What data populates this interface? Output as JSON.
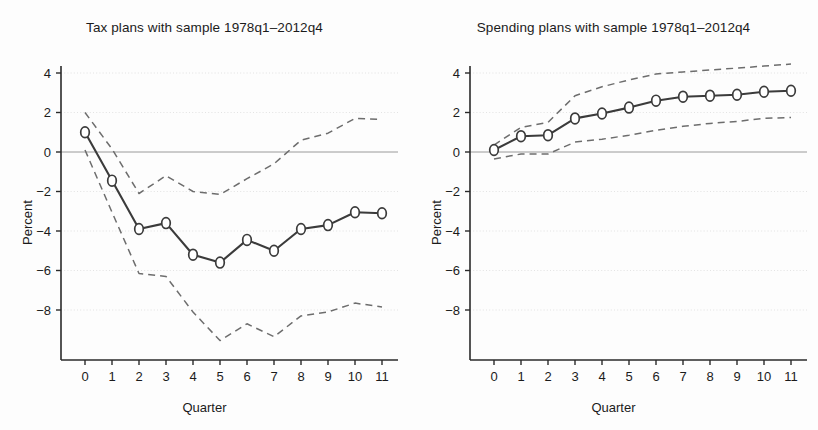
{
  "figure": {
    "axis_label_y": "Percent",
    "axis_label_x": "Quarter"
  },
  "panels": [
    {
      "title": "Tax plans with sample 1978q1–2012q4"
    },
    {
      "title": "Spending plans with sample 1978q1–2012q4"
    }
  ],
  "axes": {
    "y_ticks": [
      "4",
      "2",
      "0",
      "−2",
      "−4",
      "−6",
      "−8"
    ],
    "x_ticks": [
      "0",
      "1",
      "2",
      "3",
      "4",
      "5",
      "6",
      "7",
      "8",
      "9",
      "10",
      "11"
    ],
    "ylim": [
      -9.6,
      4.6
    ],
    "xlim": [
      -0.55,
      11.55
    ]
  },
  "style": {
    "line_color": "#3b3b3b",
    "band_color": "#6d6d6d",
    "grid_color": "#dcdcdc",
    "zero_line_color": "#9a9a9a",
    "axis_color": "#2a2a2a",
    "marker_fill": "#ffffff"
  },
  "chart_data": [
    {
      "type": "line",
      "title": "Tax plans with sample 1978q1–2012q4",
      "xlabel": "Quarter",
      "ylabel": "Percent",
      "xlim": [
        -0.55,
        11.55
      ],
      "ylim": [
        -9.6,
        4.6
      ],
      "grid": true,
      "legend": "none",
      "x": [
        0,
        1,
        2,
        3,
        4,
        5,
        6,
        7,
        8,
        9,
        10,
        11
      ],
      "series": [
        {
          "name": "Point estimate",
          "style": "solid-with-circle-markers",
          "values": [
            1.0,
            -1.45,
            -3.9,
            -3.6,
            -5.2,
            -5.6,
            -4.45,
            -5.0,
            -3.9,
            -3.7,
            -3.05,
            -3.1
          ]
        },
        {
          "name": "Upper confidence band",
          "style": "dashed",
          "values": [
            2.0,
            0.15,
            -2.1,
            -1.2,
            -2.0,
            -2.15,
            -1.35,
            -0.6,
            0.6,
            0.95,
            1.7,
            1.65
          ]
        },
        {
          "name": "Lower confidence band",
          "style": "dashed",
          "values": [
            0.1,
            -3.05,
            -6.15,
            -6.3,
            -8.1,
            -9.55,
            -8.7,
            -9.35,
            -8.3,
            -8.1,
            -7.65,
            -7.85
          ]
        }
      ]
    },
    {
      "type": "line",
      "title": "Spending plans with sample 1978q1–2012q4",
      "xlabel": "Quarter",
      "ylabel": "Percent",
      "xlim": [
        -0.55,
        11.55
      ],
      "ylim": [
        -9.6,
        4.6
      ],
      "grid": true,
      "legend": "none",
      "x": [
        0,
        1,
        2,
        3,
        4,
        5,
        6,
        7,
        8,
        9,
        10,
        11
      ],
      "series": [
        {
          "name": "Point estimate",
          "style": "solid-with-circle-markers",
          "values": [
            0.1,
            0.8,
            0.85,
            1.7,
            1.95,
            2.25,
            2.6,
            2.8,
            2.85,
            2.9,
            3.05,
            3.1
          ]
        },
        {
          "name": "Upper confidence band",
          "style": "dashed",
          "values": [
            0.35,
            1.25,
            1.5,
            2.85,
            3.3,
            3.65,
            3.95,
            4.05,
            4.15,
            4.25,
            4.35,
            4.45
          ]
        },
        {
          "name": "Lower confidence band",
          "style": "dashed",
          "values": [
            -0.35,
            -0.1,
            -0.1,
            0.5,
            0.65,
            0.85,
            1.1,
            1.3,
            1.45,
            1.55,
            1.7,
            1.75
          ]
        }
      ]
    }
  ]
}
